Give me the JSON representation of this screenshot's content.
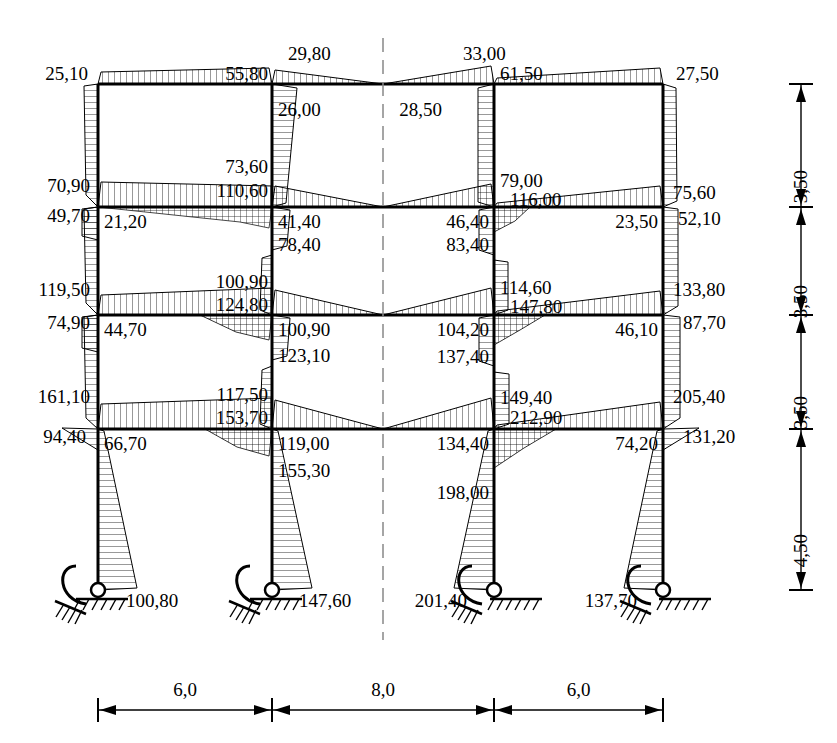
{
  "diagram": {
    "kind": "bending-moment-diagram",
    "units_note": "",
    "decimal_separator": ","
  },
  "geometry": {
    "columns_x": [
      98,
      272,
      494,
      663
    ],
    "beams_y": [
      84,
      207,
      315,
      429
    ],
    "base_y": 590,
    "centerline_x": 383
  },
  "chart_data": {
    "type": "diagram",
    "title": "",
    "xlabel": "",
    "ylabel": "",
    "storey_heights": [
      "3,50",
      "3,50",
      "3,50",
      "4,50"
    ],
    "span_widths": [
      "6,0",
      "8,0",
      "6,0"
    ],
    "moment_labels": [
      {
        "id": "m-25-10",
        "text": "25,10",
        "x": 88,
        "y": 64,
        "align": "r"
      },
      {
        "id": "m-55-80",
        "text": "55,80",
        "x": 268,
        "y": 64,
        "align": "r"
      },
      {
        "id": "m-29-80",
        "text": "29,80",
        "x": 288,
        "y": 44,
        "align": "l"
      },
      {
        "id": "m-26-00",
        "text": "26,00",
        "x": 278,
        "y": 100,
        "align": "l"
      },
      {
        "id": "m-33-00",
        "text": "33,00",
        "x": 463,
        "y": 44,
        "align": "l"
      },
      {
        "id": "m-61-50",
        "text": "61,50",
        "x": 500,
        "y": 64,
        "align": "l"
      },
      {
        "id": "m-28-50",
        "text": "28,50",
        "x": 442,
        "y": 100,
        "align": "r"
      },
      {
        "id": "m-27-50",
        "text": "27,50",
        "x": 676,
        "y": 64,
        "align": "l"
      },
      {
        "id": "m-70-90",
        "text": "70,90",
        "x": 90,
        "y": 176,
        "align": "r"
      },
      {
        "id": "m-49-70",
        "text": "49,70",
        "x": 90,
        "y": 206,
        "align": "r"
      },
      {
        "id": "m-21-20",
        "text": "21,20",
        "x": 104,
        "y": 212,
        "align": "l"
      },
      {
        "id": "m-73-60",
        "text": "73,60",
        "x": 268,
        "y": 157,
        "align": "r"
      },
      {
        "id": "m-110-60",
        "text": "110,60",
        "x": 268,
        "y": 181,
        "align": "r"
      },
      {
        "id": "m-41-40",
        "text": "41,40",
        "x": 278,
        "y": 212,
        "align": "l"
      },
      {
        "id": "m-78-40",
        "text": "78,40",
        "x": 278,
        "y": 235,
        "align": "l"
      },
      {
        "id": "m-79-00",
        "text": "79,00",
        "x": 500,
        "y": 171,
        "align": "l"
      },
      {
        "id": "m-116-00",
        "text": "116,00",
        "x": 510,
        "y": 190,
        "align": "l"
      },
      {
        "id": "m-46-40",
        "text": "46,40",
        "x": 489,
        "y": 212,
        "align": "r"
      },
      {
        "id": "m-83-40",
        "text": "83,40",
        "x": 489,
        "y": 235,
        "align": "r"
      },
      {
        "id": "m-75-60",
        "text": "75,60",
        "x": 673,
        "y": 183,
        "align": "l"
      },
      {
        "id": "m-52-10",
        "text": "52,10",
        "x": 678,
        "y": 209,
        "align": "l"
      },
      {
        "id": "m-23-50",
        "text": "23,50",
        "x": 658,
        "y": 212,
        "align": "r"
      },
      {
        "id": "m-119-50",
        "text": "119,50",
        "x": 90,
        "y": 280,
        "align": "r"
      },
      {
        "id": "m-74-90",
        "text": "74,90",
        "x": 90,
        "y": 313,
        "align": "r"
      },
      {
        "id": "m-44-70",
        "text": "44,70",
        "x": 104,
        "y": 320,
        "align": "l"
      },
      {
        "id": "m-100-90a",
        "text": "100,90",
        "x": 268,
        "y": 272,
        "align": "r"
      },
      {
        "id": "m-124-80",
        "text": "124,80",
        "x": 268,
        "y": 295,
        "align": "r"
      },
      {
        "id": "m-100-90b",
        "text": "100,90",
        "x": 278,
        "y": 320,
        "align": "l"
      },
      {
        "id": "m-123-10",
        "text": "123,10",
        "x": 278,
        "y": 346,
        "align": "l"
      },
      {
        "id": "m-114-60",
        "text": "114,60",
        "x": 500,
        "y": 278,
        "align": "l"
      },
      {
        "id": "m-147-80",
        "text": "147,80",
        "x": 510,
        "y": 297,
        "align": "l"
      },
      {
        "id": "m-104-20",
        "text": "104,20",
        "x": 489,
        "y": 320,
        "align": "r"
      },
      {
        "id": "m-137-40",
        "text": "137,40",
        "x": 489,
        "y": 347,
        "align": "r"
      },
      {
        "id": "m-133-80",
        "text": "133,80",
        "x": 673,
        "y": 280,
        "align": "l"
      },
      {
        "id": "m-87-70",
        "text": "87,70",
        "x": 683,
        "y": 313,
        "align": "l"
      },
      {
        "id": "m-46-10",
        "text": "46,10",
        "x": 658,
        "y": 320,
        "align": "r"
      },
      {
        "id": "m-161-10",
        "text": "161,10",
        "x": 90,
        "y": 387,
        "align": "r"
      },
      {
        "id": "m-94-40",
        "text": "94,40",
        "x": 86,
        "y": 427,
        "align": "r"
      },
      {
        "id": "m-66-70",
        "text": "66,70",
        "x": 104,
        "y": 434,
        "align": "l"
      },
      {
        "id": "m-117-50",
        "text": "117,50",
        "x": 268,
        "y": 385,
        "align": "r"
      },
      {
        "id": "m-153-70",
        "text": "153,70",
        "x": 268,
        "y": 408,
        "align": "r"
      },
      {
        "id": "m-119-00",
        "text": "119,00",
        "x": 278,
        "y": 434,
        "align": "l"
      },
      {
        "id": "m-155-30",
        "text": "155,30",
        "x": 278,
        "y": 461,
        "align": "l"
      },
      {
        "id": "m-149-40",
        "text": "149,40",
        "x": 500,
        "y": 388,
        "align": "l"
      },
      {
        "id": "m-212-90",
        "text": "212,90",
        "x": 510,
        "y": 408,
        "align": "l"
      },
      {
        "id": "m-134-40",
        "text": "134,40",
        "x": 489,
        "y": 434,
        "align": "r"
      },
      {
        "id": "m-198-00",
        "text": "198,00",
        "x": 489,
        "y": 483,
        "align": "r"
      },
      {
        "id": "m-205-40",
        "text": "205,40",
        "x": 673,
        "y": 387,
        "align": "l"
      },
      {
        "id": "m-131-20",
        "text": "131,20",
        "x": 683,
        "y": 427,
        "align": "l"
      },
      {
        "id": "m-74-20",
        "text": "74,20",
        "x": 658,
        "y": 434,
        "align": "r"
      },
      {
        "id": "m-100-80",
        "text": "100,80",
        "x": 126,
        "y": 591,
        "align": "l"
      },
      {
        "id": "m-147-60",
        "text": "147,60",
        "x": 299,
        "y": 591,
        "align": "l"
      },
      {
        "id": "m-201-40",
        "text": "201,40",
        "x": 467,
        "y": 591,
        "align": "r"
      },
      {
        "id": "m-137-70",
        "text": "137,70",
        "x": 637,
        "y": 591,
        "align": "r"
      }
    ]
  },
  "vertical_dimensions": [
    {
      "id": "dim-storey-4",
      "text": "3,50",
      "y_top": 84,
      "y_bot": 207
    },
    {
      "id": "dim-storey-3",
      "text": "3,50",
      "y_top": 207,
      "y_bot": 315
    },
    {
      "id": "dim-storey-2",
      "text": "3,50",
      "y_top": 315,
      "y_bot": 429
    },
    {
      "id": "dim-storey-1",
      "text": "4,50",
      "y_top": 429,
      "y_bot": 590
    }
  ],
  "horizontal_dimensions": [
    {
      "id": "dim-span-1",
      "text": "6,0",
      "x_left": 98,
      "x_right": 272
    },
    {
      "id": "dim-span-2",
      "text": "8,0",
      "x_left": 272,
      "x_right": 494
    },
    {
      "id": "dim-span-3",
      "text": "6,0",
      "x_left": 494,
      "x_right": 663
    }
  ],
  "supports": [
    {
      "id": "support-1",
      "x": 98,
      "type": "pinned-with-spring"
    },
    {
      "id": "support-2",
      "x": 272,
      "type": "pinned-with-spring"
    },
    {
      "id": "support-3",
      "x": 494,
      "type": "pinned-with-spring"
    },
    {
      "id": "support-4",
      "x": 663,
      "type": "pinned-with-spring"
    }
  ],
  "colors": {
    "line": "#000000",
    "hatch": "#000000",
    "background": "#ffffff",
    "centerline": "#888888"
  }
}
